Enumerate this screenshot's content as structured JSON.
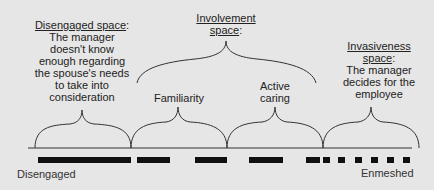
{
  "diagram": {
    "regions": [
      {
        "id": "disengaged-space",
        "title": "Disengaged space",
        "title_suffix": ":",
        "description_lines": [
          "The manager",
          "doesn't know",
          "enough regarding",
          "the spouse's needs",
          "to take into",
          "consideration"
        ]
      },
      {
        "id": "involvement-space",
        "title_lines": [
          "Involvement",
          "space"
        ],
        "title_suffix": ":",
        "sub_regions": [
          {
            "id": "familiarity",
            "label": "Familiarity"
          },
          {
            "id": "active-caring",
            "label_lines": [
              "Active",
              "caring"
            ]
          }
        ]
      },
      {
        "id": "invasiveness-space",
        "title_lines": [
          "Invasiveness",
          "space"
        ],
        "title_suffix": ":",
        "description_lines": [
          "The manager",
          "decides for the",
          "employee"
        ]
      }
    ],
    "axis": {
      "left_label": "Disengaged",
      "right_label": "Enmeshed"
    },
    "colors": {
      "background": "#e6e6e6",
      "line": "#333333",
      "dash": "#111111",
      "text": "#222222"
    }
  }
}
